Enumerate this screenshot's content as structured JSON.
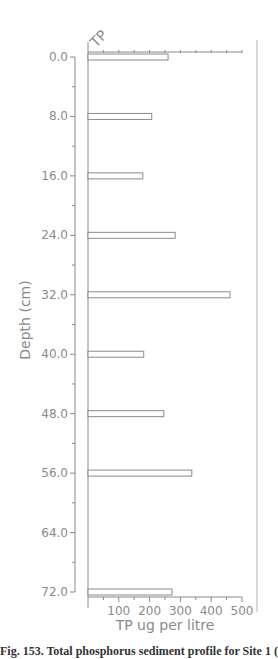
{
  "chart_data": {
    "type": "bar",
    "orientation": "horizontal",
    "title": "TP",
    "xlabel": "TP ug per litre",
    "ylabel": "Depth (cm)",
    "categories": [
      0.0,
      8.0,
      16.0,
      24.0,
      32.0,
      40.0,
      48.0,
      56.0,
      72.0
    ],
    "values": [
      260,
      207,
      178,
      283,
      461,
      181,
      246,
      337,
      273
    ],
    "xlim": [
      0,
      500
    ],
    "ylim": [
      0,
      72
    ],
    "x_ticks": [
      "100",
      "200",
      "300",
      "400",
      "500"
    ],
    "y_ticks": [
      "0.0",
      "8.0",
      "16.0",
      "24.0",
      "32.0",
      "40.0",
      "48.0",
      "56.0",
      "64.0",
      "72.0"
    ],
    "grid": false,
    "legend": null
  },
  "caption": "Fig. 153. Total phosphorus sediment profile for Site 1 (a)..."
}
